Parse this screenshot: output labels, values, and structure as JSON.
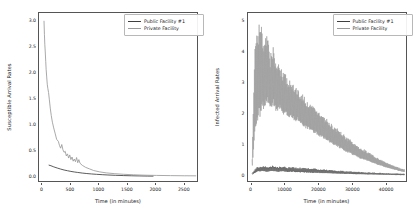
{
  "figure": {
    "background": "#ffffff",
    "panels": [
      "susceptible",
      "infected"
    ]
  },
  "colors": {
    "public_facility": "#3f3f3f",
    "private_facility": "#9a9a9a",
    "axis": "#555555",
    "text": "#1a1a1a"
  },
  "legend": {
    "public_label": "Public Facility #1",
    "private_label": "Private Facility"
  },
  "chart_data": [
    {
      "type": "line",
      "id": "susceptible",
      "title": "",
      "xlabel": "Time (in minutes)",
      "ylabel": "Susceptible Arrival Rates",
      "xlim": [
        -60,
        2750
      ],
      "ylim": [
        -0.12,
        3.15
      ],
      "xticks": [
        0,
        500,
        1000,
        1500,
        2000,
        2500
      ],
      "xticklabels": [
        "0",
        "500",
        "1000",
        "1500",
        "2000",
        "2500"
      ],
      "yticks": [
        0.0,
        0.5,
        1.0,
        1.5,
        2.0,
        2.5,
        3.0
      ],
      "yticklabels": [
        "0.0",
        "0.5",
        "1.0",
        "1.5",
        "2.0",
        "2.5",
        "3.0"
      ],
      "grid": false,
      "legend_position": "upper right",
      "series": [
        {
          "name": "Public Facility #1",
          "color": "#3f3f3f",
          "x": [
            110,
            150,
            200,
            260,
            320,
            380,
            440,
            500,
            560,
            620,
            700,
            780,
            860,
            950,
            1050,
            1150,
            1280,
            1420,
            1560,
            1700,
            1850,
            1950
          ],
          "y": [
            0.225,
            0.212,
            0.19,
            0.168,
            0.148,
            0.13,
            0.116,
            0.103,
            0.092,
            0.083,
            0.071,
            0.062,
            0.054,
            0.047,
            0.04,
            0.034,
            0.028,
            0.023,
            0.019,
            0.016,
            0.013,
            0.012
          ]
        },
        {
          "name": "Private Facility",
          "color": "#9a9a9a",
          "x": [
            28,
            35,
            42,
            50,
            58,
            66,
            75,
            85,
            95,
            108,
            122,
            138,
            155,
            175,
            198,
            222,
            250,
            280,
            300,
            320,
            340,
            360,
            380,
            400,
            420,
            440,
            460,
            480,
            500,
            520,
            540,
            560,
            580,
            600,
            620,
            640,
            660,
            700,
            760,
            830,
            900,
            1000,
            1120,
            1260,
            1420,
            1600,
            1800,
            2000,
            2250,
            2500,
            2700
          ],
          "y": [
            3.0,
            2.74,
            2.55,
            2.4,
            2.22,
            2.06,
            1.92,
            1.78,
            1.7,
            1.62,
            1.48,
            1.32,
            1.18,
            1.05,
            0.94,
            0.84,
            0.72,
            0.68,
            0.6,
            0.55,
            0.62,
            0.52,
            0.47,
            0.49,
            0.4,
            0.44,
            0.36,
            0.42,
            0.33,
            0.38,
            0.3,
            0.34,
            0.29,
            0.37,
            0.27,
            0.33,
            0.26,
            0.22,
            0.18,
            0.15,
            0.12,
            0.095,
            0.075,
            0.06,
            0.048,
            0.038,
            0.03,
            0.026,
            0.022,
            0.019,
            0.018
          ]
        }
      ]
    },
    {
      "type": "line",
      "id": "infected",
      "title": "",
      "xlabel": "Time (in minutes)",
      "ylabel": "Infected Arrival Rates",
      "xlim": [
        -1200,
        46000
      ],
      "ylim": [
        -0.22,
        5.25
      ],
      "xticks": [
        0,
        10000,
        20000,
        30000,
        40000
      ],
      "xticklabels": [
        "0",
        "10000",
        "20000",
        "30000",
        "40000"
      ],
      "yticks": [
        0,
        1,
        2,
        3,
        4,
        5
      ],
      "yticklabels": [
        "0",
        "1",
        "2",
        "3",
        "4",
        "5"
      ],
      "grid": false,
      "legend_position": "upper right",
      "series": [
        {
          "name": "Public Facility #1",
          "color": "#3f3f3f",
          "envelope_upper": [
            0.1,
            0.3,
            0.33,
            0.31,
            0.34,
            0.3,
            0.32,
            0.29,
            0.3,
            0.28,
            0.27,
            0.26,
            0.25,
            0.23,
            0.22,
            0.2,
            0.19,
            0.18,
            0.17,
            0.16,
            0.15,
            0.14,
            0.13,
            0.12,
            0.115,
            0.11,
            0.1,
            0.095,
            0.09,
            0.085,
            0.08
          ],
          "envelope_lower": [
            0.05,
            0.14,
            0.16,
            0.14,
            0.17,
            0.13,
            0.15,
            0.13,
            0.14,
            0.12,
            0.12,
            0.11,
            0.1,
            0.1,
            0.09,
            0.09,
            0.08,
            0.08,
            0.07,
            0.07,
            0.06,
            0.06,
            0.055,
            0.05,
            0.05,
            0.045,
            0.04,
            0.04,
            0.035,
            0.03,
            0.03
          ],
          "x": [
            0,
            1500,
            3000,
            4500,
            6000,
            7500,
            9000,
            10500,
            12000,
            13500,
            15000,
            16500,
            18000,
            19500,
            21000,
            22500,
            24000,
            25500,
            27000,
            28500,
            30000,
            31500,
            33000,
            34500,
            36000,
            37500,
            39000,
            40500,
            42000,
            43500,
            45000
          ]
        },
        {
          "name": "Private Facility",
          "color": "#9a9a9a",
          "envelope_upper": [
            0.6,
            4.3,
            5.05,
            5.02,
            4.4,
            4.55,
            3.95,
            4.2,
            3.5,
            3.65,
            3.35,
            3.3,
            3.1,
            3.05,
            2.9,
            2.85,
            2.7,
            2.6,
            2.45,
            2.4,
            2.3,
            2.2,
            2.1,
            2.0,
            1.9,
            1.8,
            1.7,
            1.6,
            1.55,
            1.45,
            1.35,
            1.25,
            1.2,
            1.1,
            1.05,
            0.95,
            0.9,
            0.85,
            0.78,
            0.72,
            0.66,
            0.6,
            0.55,
            0.5,
            0.45,
            0.4,
            0.36,
            0.32,
            0.28,
            0.24,
            0.22
          ],
          "envelope_lower": [
            0.2,
            1.45,
            1.75,
            2.0,
            2.2,
            2.35,
            2.1,
            2.3,
            2.05,
            2.15,
            1.95,
            2.0,
            1.85,
            1.9,
            1.75,
            1.78,
            1.65,
            1.6,
            1.5,
            1.48,
            1.4,
            1.35,
            1.28,
            1.22,
            1.16,
            1.1,
            1.04,
            0.98,
            0.94,
            0.88,
            0.82,
            0.76,
            0.73,
            0.67,
            0.64,
            0.58,
            0.55,
            0.52,
            0.48,
            0.44,
            0.4,
            0.37,
            0.34,
            0.31,
            0.28,
            0.25,
            0.22,
            0.2,
            0.17,
            0.15,
            0.13
          ],
          "x": [
            0,
            900,
            1800,
            2700,
            3600,
            4500,
            5400,
            6300,
            7200,
            8100,
            9000,
            9900,
            10800,
            11700,
            12600,
            13500,
            14400,
            15300,
            16200,
            17100,
            18000,
            18900,
            19800,
            20700,
            21600,
            22500,
            23400,
            24300,
            25200,
            26100,
            27000,
            27900,
            28800,
            29700,
            30600,
            31500,
            32400,
            33300,
            34200,
            35100,
            36000,
            36900,
            37800,
            38700,
            39600,
            40500,
            41400,
            42300,
            43200,
            44100,
            45000
          ]
        }
      ]
    }
  ]
}
